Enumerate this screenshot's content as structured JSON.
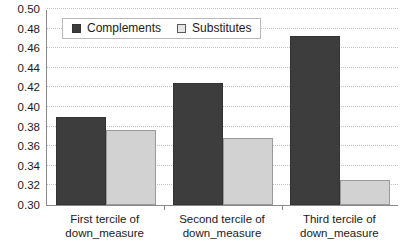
{
  "chart_data": {
    "type": "bar",
    "title": "",
    "xlabel": "",
    "ylabel": "",
    "ylim": [
      0.3,
      0.5
    ],
    "ytick_step": 0.02,
    "grid": true,
    "legend_position": "top-left-inside",
    "categories": [
      "First tercile of down_measure",
      "Second tercile of down_measure",
      "Third tercile of down_measure"
    ],
    "category_lines": [
      [
        "First tercile of",
        "down_measure"
      ],
      [
        "Second tercile of",
        "down_measure"
      ],
      [
        "Third tercile of",
        "down_measure"
      ]
    ],
    "ytick_labels": [
      "0.50",
      "0.48",
      "0.46",
      "0.44",
      "0.42",
      "0.40",
      "0.38",
      "0.36",
      "0.34",
      "0.32",
      "0.30"
    ],
    "ytick_values": [
      0.5,
      0.48,
      0.46,
      0.44,
      0.42,
      0.4,
      0.38,
      0.36,
      0.34,
      0.32,
      0.3
    ],
    "series": [
      {
        "name": "Complements",
        "color": "#3d3d3d",
        "values": [
          0.39,
          0.425,
          0.472
        ]
      },
      {
        "name": "Substitutes",
        "color": "#d2d2d2",
        "values": [
          0.377,
          0.368,
          0.326
        ]
      }
    ]
  },
  "colors": {
    "complements": "#3d3d3d",
    "substitutes": "#d2d2d2",
    "gridline": "#c2c2c2",
    "axis": "#8a8a8a",
    "background": "#ffffff",
    "text": "#1a1a1a"
  }
}
